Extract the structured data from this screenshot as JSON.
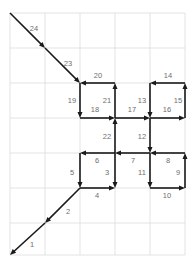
{
  "figure": {
    "title": "",
    "type": "arrow-path-diagram",
    "width": 193,
    "height": 272,
    "background": "#ffffff"
  },
  "grid": {
    "visible": true,
    "color": "#dcdcdc",
    "stroke_width": 0.8,
    "x_lines": [
      10,
      45,
      80,
      115,
      150,
      185
    ],
    "y_lines": [
      13,
      48,
      83,
      118,
      153,
      188,
      223,
      255
    ],
    "cell_width": 35,
    "cell_height": 35
  },
  "arrows": {
    "color": "#1a1a1a",
    "stroke_width": 1.6,
    "head_length": 6,
    "head_width": 5,
    "label_color": "#6e6e6e",
    "label_font_size": 7.5,
    "items": [
      {
        "id": 1,
        "label": "1",
        "direction": "down-left",
        "x1": 45,
        "y1": 223,
        "x2": 10,
        "y2": 255,
        "lx": 32,
        "ly": 245
      },
      {
        "id": 2,
        "label": "2",
        "direction": "down-left",
        "x1": 80,
        "y1": 188,
        "x2": 45,
        "y2": 223,
        "lx": 68,
        "ly": 212
      },
      {
        "id": 3,
        "label": "3",
        "direction": "down",
        "x1": 115,
        "y1": 153,
        "x2": 115,
        "y2": 188,
        "lx": 107,
        "ly": 173
      },
      {
        "id": 4,
        "label": "4",
        "direction": "right",
        "x1": 80,
        "y1": 188,
        "x2": 115,
        "y2": 188,
        "lx": 97,
        "ly": 196
      },
      {
        "id": 5,
        "label": "5",
        "direction": "down",
        "x1": 80,
        "y1": 153,
        "x2": 80,
        "y2": 188,
        "lx": 72,
        "ly": 173
      },
      {
        "id": 6,
        "label": "6",
        "direction": "left",
        "x1": 115,
        "y1": 153,
        "x2": 80,
        "y2": 153,
        "lx": 97,
        "ly": 161
      },
      {
        "id": 7,
        "label": "7",
        "direction": "left",
        "x1": 150,
        "y1": 153,
        "x2": 115,
        "y2": 153,
        "lx": 133,
        "ly": 161
      },
      {
        "id": 8,
        "label": "8",
        "direction": "left",
        "x1": 185,
        "y1": 153,
        "x2": 150,
        "y2": 153,
        "lx": 168,
        "ly": 161
      },
      {
        "id": 9,
        "label": "9",
        "direction": "up",
        "x1": 185,
        "y1": 188,
        "x2": 185,
        "y2": 153,
        "lx": 178,
        "ly": 173
      },
      {
        "id": 10,
        "label": "10",
        "direction": "right",
        "x1": 150,
        "y1": 188,
        "x2": 185,
        "y2": 188,
        "lx": 167,
        "ly": 196
      },
      {
        "id": 11,
        "label": "11",
        "direction": "down",
        "x1": 150,
        "y1": 153,
        "x2": 150,
        "y2": 188,
        "lx": 142,
        "ly": 173
      },
      {
        "id": 12,
        "label": "12",
        "direction": "down",
        "x1": 150,
        "y1": 118,
        "x2": 150,
        "y2": 153,
        "lx": 142,
        "ly": 137
      },
      {
        "id": 13,
        "label": "13",
        "direction": "down",
        "x1": 150,
        "y1": 83,
        "x2": 150,
        "y2": 118,
        "lx": 142,
        "ly": 101
      },
      {
        "id": 14,
        "label": "14",
        "direction": "left",
        "x1": 185,
        "y1": 83,
        "x2": 150,
        "y2": 83,
        "lx": 168,
        "ly": 76
      },
      {
        "id": 15,
        "label": "15",
        "direction": "up",
        "x1": 185,
        "y1": 118,
        "x2": 185,
        "y2": 83,
        "lx": 178,
        "ly": 101
      },
      {
        "id": 16,
        "label": "16",
        "direction": "right",
        "x1": 150,
        "y1": 118,
        "x2": 185,
        "y2": 118,
        "lx": 167,
        "ly": 110
      },
      {
        "id": 17,
        "label": "17",
        "direction": "right",
        "x1": 115,
        "y1": 118,
        "x2": 150,
        "y2": 118,
        "lx": 132,
        "ly": 110
      },
      {
        "id": 18,
        "label": "18",
        "direction": "right",
        "x1": 80,
        "y1": 118,
        "x2": 115,
        "y2": 118,
        "lx": 95,
        "ly": 110
      },
      {
        "id": 19,
        "label": "19",
        "direction": "down",
        "x1": 80,
        "y1": 83,
        "x2": 80,
        "y2": 118,
        "lx": 72,
        "ly": 101
      },
      {
        "id": 20,
        "label": "20",
        "direction": "left",
        "x1": 115,
        "y1": 83,
        "x2": 80,
        "y2": 83,
        "lx": 98,
        "ly": 76
      },
      {
        "id": 21,
        "label": "21",
        "direction": "up",
        "x1": 115,
        "y1": 118,
        "x2": 115,
        "y2": 83,
        "lx": 107,
        "ly": 101
      },
      {
        "id": 22,
        "label": "22",
        "direction": "up",
        "x1": 115,
        "y1": 153,
        "x2": 115,
        "y2": 118,
        "lx": 107,
        "ly": 137
      },
      {
        "id": 23,
        "label": "23",
        "direction": "down-right",
        "x1": 45,
        "y1": 48,
        "x2": 80,
        "y2": 83,
        "lx": 68,
        "ly": 64
      },
      {
        "id": 24,
        "label": "24",
        "direction": "down-right",
        "x1": 10,
        "y1": 13,
        "x2": 45,
        "y2": 48,
        "lx": 34,
        "ly": 29
      }
    ]
  }
}
